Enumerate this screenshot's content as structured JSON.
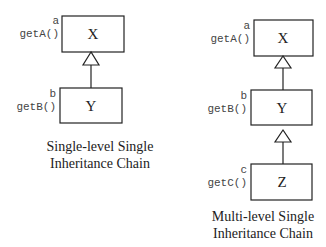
{
  "left_diagram": {
    "classes": [
      {
        "name": "X",
        "attribute": "a",
        "method": "getA()"
      },
      {
        "name": "Y",
        "attribute": "b",
        "method": "getB()"
      }
    ],
    "caption": [
      "Single-level Single",
      "Inheritance Chain"
    ]
  },
  "right_diagram": {
    "classes": [
      {
        "name": "X",
        "attribute": "a",
        "method": "getA()"
      },
      {
        "name": "Y",
        "attribute": "b",
        "method": "getB()"
      },
      {
        "name": "Z",
        "attribute": "c",
        "method": "getC()"
      }
    ],
    "caption": [
      "Multi-level Single",
      "Inheritance Chain"
    ]
  }
}
